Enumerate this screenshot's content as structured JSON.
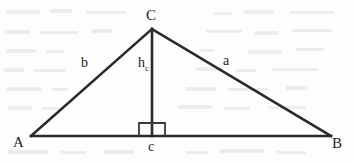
{
  "figure": {
    "type": "geometry-diagram",
    "background_color": "#fdfdfd",
    "stroke_color": "#2a2a2a",
    "label_color": "#1d1d1d",
    "stroke_width": 2.6
  },
  "vertices": {
    "A": {
      "label": "A",
      "x": 31,
      "y": 136
    },
    "B": {
      "label": "B",
      "x": 331,
      "y": 136
    },
    "C": {
      "label": "C",
      "x": 152,
      "y": 29
    },
    "foot": {
      "label": "",
      "x": 152,
      "y": 136
    }
  },
  "sides": {
    "a": {
      "label": "a",
      "from": "C",
      "to": "B"
    },
    "b": {
      "label": "b",
      "from": "A",
      "to": "C"
    },
    "c": {
      "label": "c",
      "from": "A",
      "to": "B"
    }
  },
  "altitude": {
    "label": "h",
    "subscript": "c",
    "from": "C",
    "to": "foot"
  },
  "right_angle": {
    "marker": "square",
    "x": 139,
    "y": 123,
    "width": 26,
    "height": 13
  },
  "labels": {
    "vertex_a": "A",
    "vertex_b": "B",
    "vertex_c": "C",
    "side_a": "a",
    "side_b": "b",
    "side_c": "c",
    "altitude_base": "h",
    "altitude_sub": "c"
  }
}
